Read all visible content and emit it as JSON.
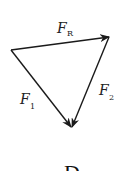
{
  "diagram": {
    "type": "vector-triangle",
    "vectors": [
      {
        "name": "F_R",
        "label": "F",
        "subscript": "R",
        "from": "left",
        "to": "top-right"
      },
      {
        "name": "F_1",
        "label": "F",
        "subscript": "1",
        "from": "left",
        "to": "bottom"
      },
      {
        "name": "F_2",
        "label": "F",
        "subscript": "2",
        "from": "top-right",
        "to": "bottom"
      }
    ],
    "option_label": "D",
    "colors": {
      "stroke": "#1a1a1a",
      "text": "#222222"
    }
  }
}
